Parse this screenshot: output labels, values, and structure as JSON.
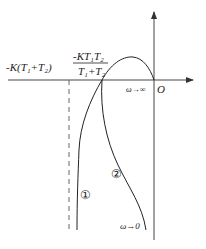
{
  "figure": {
    "type": "nyquist-plot",
    "axes": {
      "origin_label": "O",
      "x_axis": "real",
      "y_axis": "imaginary"
    },
    "labels": {
      "asymptote": "-K(T₁+T₂)",
      "crossing_num": "-KT₁T₂",
      "crossing_den": "T₁+T₂",
      "omega_inf": "ω→∞",
      "omega_zero": "ω→0",
      "curve1": "①",
      "curve2": "②"
    },
    "colors": {
      "line": "#222222",
      "axis": "#555555",
      "dashed": "#666666"
    }
  }
}
